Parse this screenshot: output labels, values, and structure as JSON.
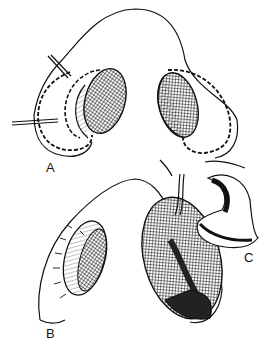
{
  "figure": {
    "type": "surgical illustration",
    "panels": [
      {
        "id": "A",
        "label": "A"
      },
      {
        "id": "B",
        "label": "B"
      },
      {
        "id": "C",
        "label": "C"
      }
    ]
  },
  "colors": {
    "ink": "#111111",
    "background": "#ffffff"
  }
}
